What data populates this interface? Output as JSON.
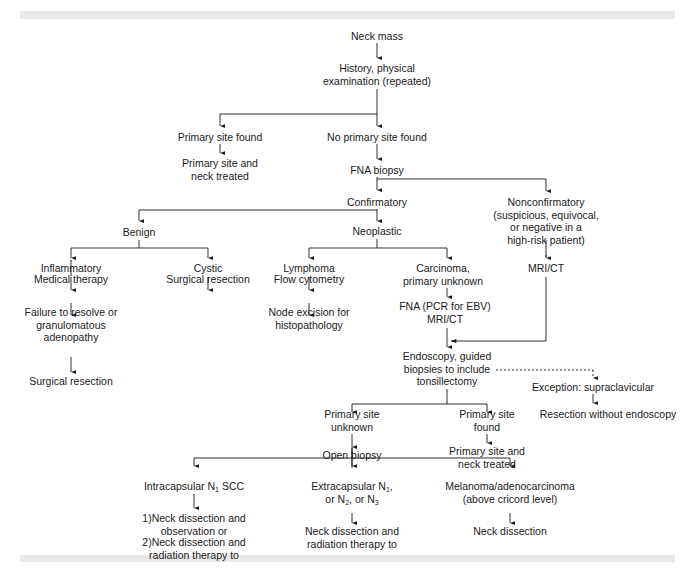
{
  "diagram": {
    "type": "flowchart",
    "title_visible": false,
    "colors": {
      "line": "#1a1a1a",
      "text": "#1a1a1a",
      "band": "#e9e9e9",
      "background": "#ffffff"
    },
    "nodes": {
      "neck_mass": {
        "lines": [
          "Neck mass"
        ]
      },
      "history": {
        "lines": [
          "History, physical",
          "examination (repeated)"
        ]
      },
      "primary_found_top": {
        "lines": [
          "Primary site found"
        ]
      },
      "no_primary_found": {
        "lines": [
          "No primary site found"
        ]
      },
      "primary_treated_top": {
        "lines": [
          "Primary site and",
          "neck treated"
        ]
      },
      "fna_biopsy": {
        "lines": [
          "FNA biopsy"
        ]
      },
      "confirmatory": {
        "lines": [
          "Confirmatory"
        ]
      },
      "nonconfirmatory": {
        "lines": [
          "Nonconfirmatory",
          "(suspicious, equivocal,",
          "or negative in a",
          "high-risk patient)"
        ]
      },
      "benign": {
        "lines": [
          "Benign"
        ]
      },
      "neoplastic": {
        "lines": [
          "Neoplastic"
        ]
      },
      "inflammatory": {
        "lines": [
          "Inflammatory"
        ]
      },
      "cystic": {
        "lines": [
          "Cystic"
        ]
      },
      "lymphoma": {
        "lines": [
          "Lymphoma"
        ]
      },
      "carcinoma": {
        "lines": [
          "Carcinoma,",
          "primary unknown"
        ]
      },
      "mri_ct_right": {
        "lines": [
          "MRI/CT"
        ]
      },
      "medical_therapy": {
        "lines": [
          "Medical therapy"
        ]
      },
      "surgical_resection_cystic": {
        "lines": [
          "Surgical resection"
        ]
      },
      "flow_cytometry": {
        "lines": [
          "Flow cytometry"
        ]
      },
      "fna_pcr": {
        "lines": [
          "FNA (PCR for EBV)",
          "MRI/CT"
        ]
      },
      "failure_to_resolve": {
        "lines": [
          "Failure to resolve or",
          "granulomatous",
          "adenopathy"
        ]
      },
      "node_excision": {
        "lines": [
          "Node excision for",
          "histopathology"
        ]
      },
      "surgical_resection_inflam": {
        "lines": [
          "Surgical resection"
        ]
      },
      "endoscopy": {
        "lines": [
          "Endoscopy, guided",
          "biopsies to include",
          "tonsillectomy"
        ]
      },
      "exception": {
        "lines": [
          "Exception: supraclavicular"
        ]
      },
      "resection_without_endoscopy": {
        "lines": [
          "Resection without endoscopy"
        ]
      },
      "primary_unknown": {
        "lines": [
          "Primary site",
          "unknown"
        ]
      },
      "primary_found_bottom": {
        "lines": [
          "Primary site",
          "found"
        ]
      },
      "open_biopsy": {
        "lines": [
          "Open biopsy"
        ]
      },
      "primary_treated_bottom": {
        "lines": [
          "Primary site and",
          "neck treated"
        ]
      },
      "intracapsular": {
        "pre": "Intracapsular N",
        "sub": "1",
        "post": " SCC"
      },
      "extracapsular": {
        "line1_pre": "Extracapsular N",
        "line1_sub": "1",
        "line1_post": ",",
        "line2_a": "or N",
        "line2_sub_a": "2",
        "line2_b": ", or N",
        "line2_sub_b": "3"
      },
      "melanoma": {
        "lines": [
          "Melanoma/adenocarcinoma",
          "(above cricord level)"
        ]
      },
      "option1": {
        "lines": [
          "1)Neck dissection and",
          "observation or"
        ]
      },
      "option2": {
        "lines": [
          "2)Neck dissection and",
          "radiation therapy to"
        ]
      },
      "neck_dissection_rt": {
        "lines": [
          "Neck dissection and",
          "radiation therapy to"
        ]
      },
      "neck_dissection": {
        "lines": [
          "Neck dissection"
        ]
      }
    },
    "edges": [
      [
        "neck_mass",
        "history"
      ],
      [
        "history",
        "primary_found_top"
      ],
      [
        "history",
        "no_primary_found"
      ],
      [
        "primary_found_top",
        "primary_treated_top"
      ],
      [
        "no_primary_found",
        "fna_biopsy"
      ],
      [
        "fna_biopsy",
        "confirmatory"
      ],
      [
        "fna_biopsy",
        "nonconfirmatory"
      ],
      [
        "confirmatory",
        "benign"
      ],
      [
        "confirmatory",
        "neoplastic"
      ],
      [
        "benign",
        "inflammatory"
      ],
      [
        "benign",
        "cystic"
      ],
      [
        "neoplastic",
        "lymphoma"
      ],
      [
        "neoplastic",
        "carcinoma"
      ],
      [
        "nonconfirmatory",
        "mri_ct_right"
      ],
      [
        "inflammatory",
        "medical_therapy"
      ],
      [
        "cystic",
        "surgical_resection_cystic"
      ],
      [
        "lymphoma",
        "flow_cytometry"
      ],
      [
        "carcinoma",
        "fna_pcr"
      ],
      [
        "medical_therapy",
        "failure_to_resolve"
      ],
      [
        "flow_cytometry",
        "node_excision"
      ],
      [
        "failure_to_resolve",
        "surgical_resection_inflam"
      ],
      [
        "fna_pcr",
        "endoscopy"
      ],
      [
        "mri_ct_right",
        "endoscopy"
      ],
      [
        "endoscopy",
        "exception",
        "dashed"
      ],
      [
        "exception",
        "resection_without_endoscopy"
      ],
      [
        "endoscopy",
        "primary_unknown"
      ],
      [
        "endoscopy",
        "primary_found_bottom"
      ],
      [
        "primary_unknown",
        "open_biopsy"
      ],
      [
        "primary_found_bottom",
        "primary_treated_bottom"
      ],
      [
        "open_biopsy",
        "intracapsular"
      ],
      [
        "open_biopsy",
        "extracapsular"
      ],
      [
        "open_biopsy",
        "melanoma"
      ],
      [
        "intracapsular",
        "option1"
      ],
      [
        "extracapsular",
        "neck_dissection_rt"
      ],
      [
        "melanoma",
        "neck_dissection"
      ]
    ]
  }
}
